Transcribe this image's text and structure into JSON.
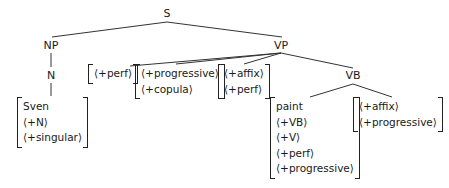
{
  "tree": {
    "root": "S",
    "nodes": {
      "S": "S",
      "NP": "NP",
      "N": "N",
      "VP": "VP",
      "VB": "VB"
    },
    "feature_boxes": {
      "sven": [
        "Sven",
        "⟨+N⟩",
        "⟨+singular⟩"
      ],
      "perf": [
        "⟨+perf⟩"
      ],
      "progressive_copula": [
        "⟨+progressive⟩",
        "⟨+copula⟩"
      ],
      "affix_perf": [
        "⟨+affix⟩",
        "⟨+perf⟩"
      ],
      "paint": [
        "paint",
        "⟨+VB⟩",
        "⟨+V⟩",
        "⟨+perf⟩",
        "⟨+progressive⟩"
      ],
      "affix_progressive": [
        "⟨+affix⟩",
        "⟨+progressive⟩"
      ]
    },
    "edges": [
      [
        "S",
        "NP"
      ],
      [
        "S",
        "VP"
      ],
      [
        "NP",
        "N"
      ],
      [
        "N",
        "Sven"
      ],
      [
        "VP",
        "perf"
      ],
      [
        "VP",
        "progressive_copula"
      ],
      [
        "VP",
        "affix_perf"
      ],
      [
        "VP",
        "VB"
      ],
      [
        "VB",
        "paint"
      ],
      [
        "VB",
        "affix_progressive"
      ]
    ]
  }
}
